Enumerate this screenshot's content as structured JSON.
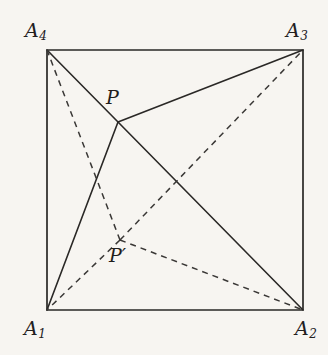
{
  "figure": {
    "background_color": "#f7f5f1",
    "stroke_color": "#2a2826",
    "dashed_stroke_color": "#3a3836",
    "solid_stroke_width": 1.6,
    "dashed_stroke_width": 1.5,
    "dash_pattern": "6,5"
  },
  "labels": {
    "a4": {
      "base": "A",
      "sub": "4"
    },
    "a3": {
      "base": "A",
      "sub": "3"
    },
    "a1": {
      "base": "A",
      "sub": "1"
    },
    "a2": {
      "base": "A",
      "sub": "2"
    },
    "p": "P",
    "p_prime": "P′"
  },
  "chart_data": {
    "type": "scatter",
    "xlabel": "",
    "ylabel": "",
    "xlim": [
      0,
      328
    ],
    "ylim": [
      0,
      355
    ],
    "grid": false,
    "legend": "none",
    "points": [
      {
        "name": "A1",
        "label": "A₁",
        "x": 47,
        "y": 310,
        "role": "square-vertex",
        "corner": "bottom-left"
      },
      {
        "name": "A2",
        "label": "A₂",
        "x": 303,
        "y": 310,
        "role": "square-vertex",
        "corner": "bottom-right"
      },
      {
        "name": "A3",
        "label": "A₃",
        "x": 303,
        "y": 50,
        "role": "square-vertex",
        "corner": "top-right"
      },
      {
        "name": "A4",
        "label": "A₄",
        "x": 47,
        "y": 50,
        "role": "square-vertex",
        "corner": "top-left"
      },
      {
        "name": "P",
        "label": "P",
        "x": 118,
        "y": 122,
        "role": "interior-point",
        "style": "solid"
      },
      {
        "name": "Pprime",
        "label": "P′",
        "x": 120,
        "y": 240,
        "role": "interior-point",
        "style": "dashed"
      }
    ],
    "square": {
      "vertices": [
        "A1",
        "A2",
        "A3",
        "A4"
      ],
      "path": "M 47 310 L 303 310 L 303 50 L 47 50 Z",
      "style": "solid"
    },
    "segments": [
      {
        "from": "P",
        "to": "A4",
        "x1": 118,
        "y1": 122,
        "x2": 47,
        "y2": 50,
        "style": "solid"
      },
      {
        "from": "P",
        "to": "A3",
        "x1": 118,
        "y1": 122,
        "x2": 303,
        "y2": 50,
        "style": "solid"
      },
      {
        "from": "P",
        "to": "A1",
        "x1": 118,
        "y1": 122,
        "x2": 47,
        "y2": 310,
        "style": "solid"
      },
      {
        "from": "P",
        "to": "A2",
        "x1": 118,
        "y1": 122,
        "x2": 303,
        "y2": 310,
        "style": "solid"
      },
      {
        "from": "Pprime",
        "to": "A4",
        "x1": 120,
        "y1": 240,
        "x2": 47,
        "y2": 50,
        "style": "dashed"
      },
      {
        "from": "Pprime",
        "to": "A3",
        "x1": 120,
        "y1": 240,
        "x2": 303,
        "y2": 50,
        "style": "dashed"
      },
      {
        "from": "Pprime",
        "to": "A1",
        "x1": 120,
        "y1": 240,
        "x2": 47,
        "y2": 310,
        "style": "dashed"
      },
      {
        "from": "Pprime",
        "to": "A2",
        "x1": 120,
        "y1": 240,
        "x2": 303,
        "y2": 310,
        "style": "dashed"
      }
    ]
  }
}
